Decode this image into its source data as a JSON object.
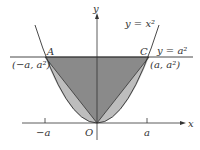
{
  "diagram": {
    "axes": {
      "x_label": "x",
      "y_label": "y",
      "origin_label": "O"
    },
    "ticks": {
      "neg_a": "−a",
      "pos_a": "a"
    },
    "curves": {
      "parabola": "y = x²",
      "line": "y = a²"
    },
    "points": {
      "A": {
        "name": "A",
        "coords": "(−a, a²)"
      },
      "C": {
        "name": "C",
        "coords": "(a, a²)"
      }
    },
    "colors": {
      "dark_region": "#8a8a8a",
      "light_region": "#bdbdbd",
      "stroke": "#333333"
    }
  }
}
